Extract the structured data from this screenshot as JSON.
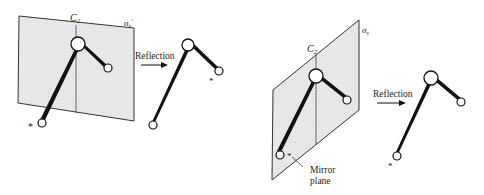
{
  "figure": {
    "left_panel": {
      "axis_label": "C",
      "axis_subscript": "2",
      "plane_label": "σ",
      "plane_subscript": "v",
      "plane_prime": "′",
      "operation_label": "Reflection",
      "star_original": "*",
      "star_reflected": "*"
    },
    "right_panel": {
      "axis_label": "C",
      "axis_subscript": "2",
      "plane_label": "σ",
      "plane_subscript": "v",
      "operation_label": "Reflection",
      "star_original": "*",
      "star_reflected": "*",
      "mirror_label_line1": "Mirror",
      "mirror_label_line2": "plane"
    },
    "colors": {
      "plane_fill": "#e6e6e6",
      "line": "#1a1a1a",
      "background": "#ffffff"
    }
  }
}
